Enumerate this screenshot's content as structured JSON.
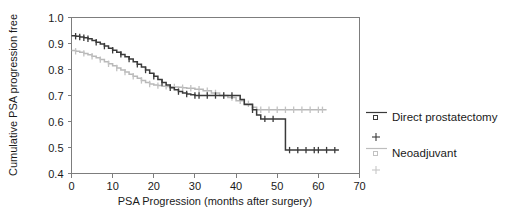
{
  "chart_data": {
    "type": "line",
    "title": "",
    "xlabel": "PSA Progression (months after surgery)",
    "ylabel": "Cumulative PSA progression free",
    "xlim": [
      0,
      70
    ],
    "ylim": [
      0.4,
      1.0
    ],
    "xticks": [
      "0",
      "10",
      "20",
      "30",
      "40",
      "50",
      "60",
      "70"
    ],
    "xtick_values": [
      0,
      10,
      20,
      30,
      40,
      50,
      60,
      70
    ],
    "yticks": [
      "1.0",
      "0.9",
      "0.8",
      "0.7",
      "0.6",
      "0.5",
      "0.4"
    ],
    "ytick_values": [
      1.0,
      0.9,
      0.8,
      0.7,
      0.6,
      0.5,
      0.4
    ],
    "grid": false,
    "legend_position": "right",
    "series": [
      {
        "name": "Direct prostatectomy",
        "color": "#3a3a3a",
        "marker": "square",
        "censor_symbol": "+",
        "x": [
          0,
          1,
          2,
          3,
          4,
          5,
          6,
          7,
          8,
          9,
          10,
          11,
          12,
          13,
          14,
          15,
          16,
          17,
          18,
          19,
          20,
          21,
          22,
          23,
          24,
          25,
          26,
          27,
          28,
          29,
          30,
          31,
          32,
          34,
          36,
          38,
          40,
          41,
          42,
          43,
          44,
          45,
          46,
          47,
          48,
          50,
          52,
          55,
          58,
          61,
          65
        ],
        "values": [
          0.93,
          0.928,
          0.925,
          0.922,
          0.918,
          0.912,
          0.905,
          0.898,
          0.89,
          0.882,
          0.874,
          0.866,
          0.858,
          0.849,
          0.84,
          0.83,
          0.82,
          0.81,
          0.798,
          0.786,
          0.774,
          0.762,
          0.75,
          0.74,
          0.73,
          0.722,
          0.715,
          0.71,
          0.706,
          0.703,
          0.7,
          0.7,
          0.7,
          0.7,
          0.7,
          0.7,
          0.7,
          0.685,
          0.665,
          0.665,
          0.645,
          0.625,
          0.61,
          0.61,
          0.61,
          0.61,
          0.49,
          0.49,
          0.49,
          0.49,
          0.49
        ],
        "censored_x": [
          1,
          2,
          3,
          4,
          6,
          8,
          10,
          12,
          14,
          16,
          18,
          20,
          22,
          24,
          26,
          28,
          30,
          31,
          33,
          35,
          37,
          39,
          44,
          47,
          49,
          53,
          55,
          57,
          59,
          60,
          62,
          64
        ],
        "plateau_value": 0.49,
        "start_value": 0.93
      },
      {
        "name": "Neoadjuvant",
        "color": "#bdbdbd",
        "marker": "square",
        "censor_symbol": "+",
        "x": [
          0,
          1,
          2,
          3,
          4,
          5,
          6,
          7,
          8,
          9,
          10,
          11,
          12,
          13,
          14,
          15,
          16,
          17,
          18,
          19,
          20,
          21,
          22,
          23,
          24,
          25,
          26,
          27,
          28,
          30,
          32,
          34,
          36,
          38,
          40,
          42,
          44,
          45,
          46,
          48,
          50,
          53,
          56,
          59,
          62
        ],
        "values": [
          0.873,
          0.87,
          0.866,
          0.862,
          0.857,
          0.851,
          0.845,
          0.838,
          0.83,
          0.822,
          0.814,
          0.806,
          0.798,
          0.79,
          0.782,
          0.774,
          0.766,
          0.758,
          0.75,
          0.744,
          0.74,
          0.738,
          0.736,
          0.735,
          0.734,
          0.733,
          0.732,
          0.73,
          0.728,
          0.724,
          0.718,
          0.71,
          0.7,
          0.692,
          0.68,
          0.668,
          0.655,
          0.645,
          0.645,
          0.645,
          0.645,
          0.645,
          0.645,
          0.645,
          0.645
        ],
        "censored_x": [
          1,
          3,
          5,
          7,
          9,
          11,
          13,
          15,
          17,
          19,
          21,
          23,
          25,
          27,
          29,
          31,
          33,
          35,
          37,
          39,
          41,
          43,
          46,
          48,
          50,
          52,
          54,
          56,
          58,
          60,
          61
        ],
        "plateau_value": 0.645,
        "start_value": 0.873
      }
    ]
  },
  "legend": {
    "entries": [
      {
        "label": "Direct prostatectomy",
        "kind": "line-square",
        "color": "#3a3a3a"
      },
      {
        "label": "",
        "kind": "plus",
        "color": "#3a3a3a"
      },
      {
        "label": "Neoadjuvant",
        "kind": "line-square",
        "color": "#bdbdbd"
      },
      {
        "label": "",
        "kind": "plus",
        "color": "#c6c6c6"
      }
    ]
  }
}
